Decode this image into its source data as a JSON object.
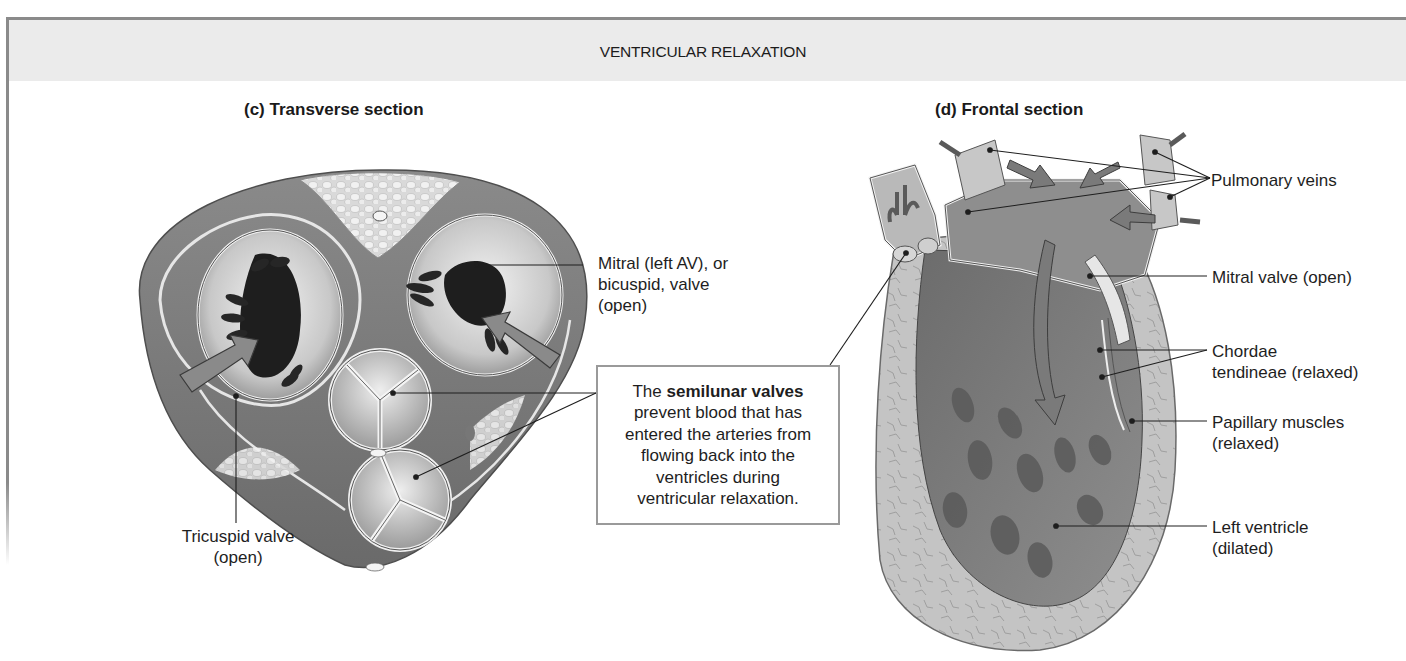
{
  "figure": {
    "header_title": "VENTRICULAR RELAXATION",
    "panels": [
      {
        "id": "c",
        "title": "(c) Transverse section",
        "labels": {
          "mitral_line1": "Mitral (left AV), or",
          "mitral_line2": "bicuspid, valve",
          "mitral_line3": "(open)",
          "tricuspid_line1": "Tricuspid valve",
          "tricuspid_line2": "(open)"
        },
        "callout": {
          "prefix": "The",
          "bold": "semilunar valves",
          "line2": "prevent blood that has",
          "line3": "entered the arteries from",
          "line4": "flowing back into the",
          "line5": "ventricles during",
          "line6": "ventricular relaxation."
        }
      },
      {
        "id": "d",
        "title": "(d) Frontal section",
        "labels": {
          "pulmonary_veins": "Pulmonary veins",
          "mitral_valve": "Mitral valve (open)",
          "chordae_line1": "Chordae",
          "chordae_line2": "tendineae (relaxed)",
          "papillary_line1": "Papillary muscles",
          "papillary_line2": "(relaxed)",
          "left_ventricle_line1": "Left ventricle",
          "left_ventricle_line2": "(dilated)"
        }
      }
    ],
    "colors": {
      "header_band": "#ebebeb",
      "frame": "#8a8a8a",
      "tissue_dark": "#6e6e6e",
      "tissue_mid": "#9c9c9c",
      "tissue_light": "#d2d2d2",
      "arrow": "#7a7a7a"
    }
  }
}
